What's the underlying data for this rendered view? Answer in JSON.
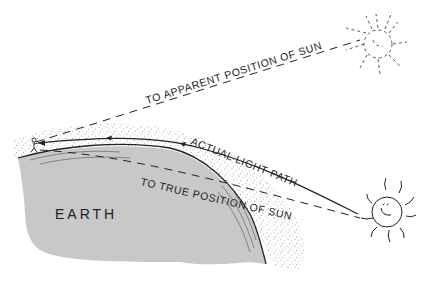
{
  "diagram": {
    "type": "atmospheric-refraction",
    "labels": {
      "apparent": "TO APPARENT POSITION OF SUN",
      "actual": "ACTUAL LIGHT PATH",
      "true": "TO TRUE POSITION OF SUN",
      "earth": "EARTH"
    },
    "elements": [
      {
        "name": "earth",
        "shape": "gray landmass"
      },
      {
        "name": "atmosphere",
        "shape": "stippled layer"
      },
      {
        "name": "observer",
        "shape": "small person figure"
      },
      {
        "name": "true-sun",
        "shape": "solid sun with face"
      },
      {
        "name": "apparent-sun",
        "shape": "dashed ghost sun"
      }
    ],
    "colors": {
      "earth": "#c8c8c8",
      "ink": "#222222",
      "stipple": "#888888"
    }
  }
}
